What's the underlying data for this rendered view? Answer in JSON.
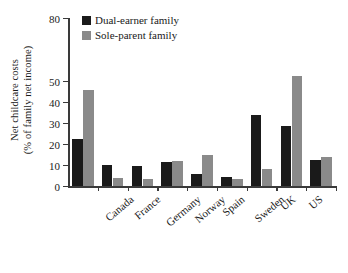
{
  "chart_data": {
    "type": "bar",
    "title": "",
    "xlabel": "",
    "ylabel": "Net childcare costs (% of family net income)",
    "ylabel_line1": "Net childcare costs",
    "ylabel_line2": "(% of family net income)",
    "ylim": [
      0,
      80
    ],
    "ytick_values": [
      0,
      10,
      20,
      30,
      40,
      50,
      80
    ],
    "ytick_labels": [
      "0",
      "10",
      "20",
      "30",
      "40",
      "50",
      "80"
    ],
    "grid": false,
    "legend_position": "top-left-inside",
    "categories": [
      "Canada",
      "France",
      "Germany",
      "Norway",
      "Spain",
      "Sweden",
      "UK",
      "US",
      "OECD Average"
    ],
    "series": [
      {
        "name": "Dual-earner family",
        "color": "#1a1a1a",
        "values": [
          22.2,
          10.0,
          9.5,
          11.2,
          5.6,
          4.3,
          33.8,
          28.7,
          12.3
        ]
      },
      {
        "name": "Sole-parent family",
        "color": "#8a8a8a",
        "values": [
          45.5,
          3.8,
          3.2,
          12.1,
          14.9,
          3.2,
          8.0,
          52.2,
          13.8
        ]
      }
    ]
  },
  "legend": {
    "items": [
      {
        "label": "Dual-earner family",
        "color": "#1a1a1a"
      },
      {
        "label": "Sole-parent family",
        "color": "#8a8a8a"
      }
    ]
  },
  "axis": {
    "line_color": "#3a3a3a"
  }
}
